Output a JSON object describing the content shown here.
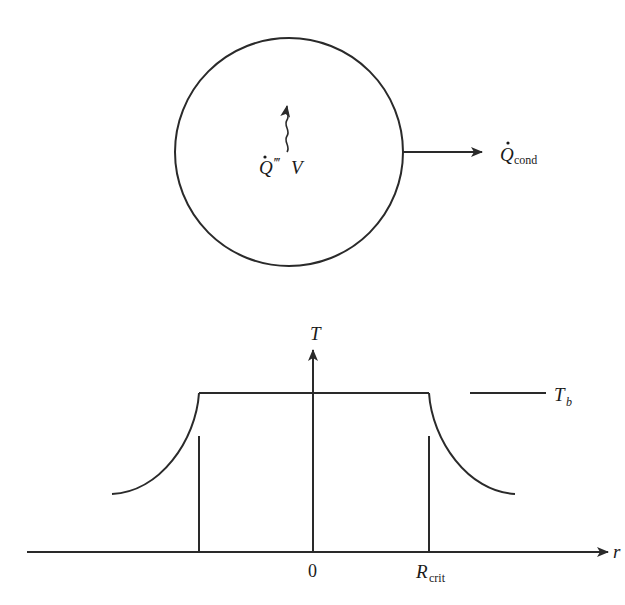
{
  "figure": {
    "top": {
      "shape": "circle",
      "center": [
        289,
        152
      ],
      "radius": 114,
      "source_label": {
        "main": "Q",
        "primes": "‴",
        "tail": "V"
      },
      "flux_label": {
        "main": "Q",
        "sub": "cond"
      }
    },
    "bottom": {
      "y_axis_label": "T",
      "x_axis_label": "r",
      "origin_label": "0",
      "rcrit_label": {
        "main": "R",
        "sub": "crit"
      },
      "tb_label": {
        "main": "T",
        "sub": "b"
      }
    },
    "colors": {
      "stroke": "#2a2a2a",
      "background": "#ffffff"
    }
  }
}
